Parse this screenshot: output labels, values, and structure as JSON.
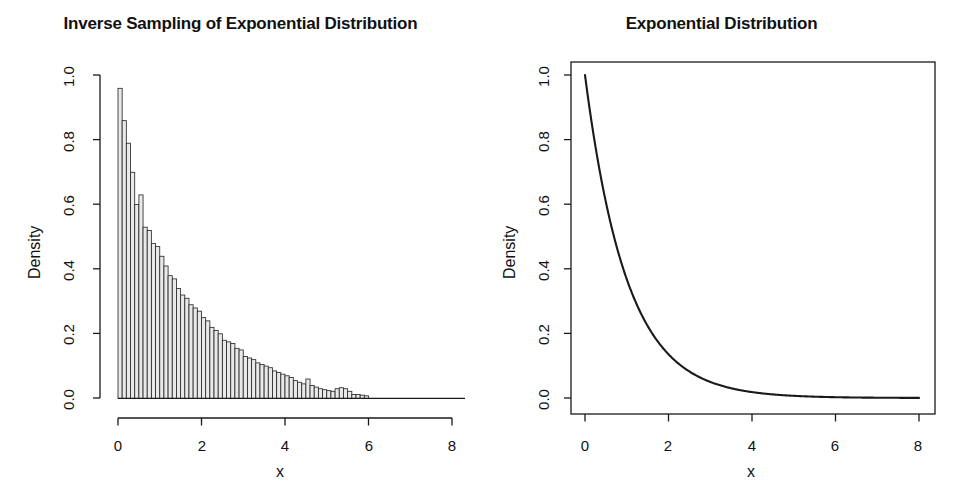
{
  "figure": {
    "background": "#ffffff",
    "foreground": "#1a1a1a",
    "bar_fill": "#e9e9e9",
    "bar_stroke": "#2b2b2b"
  },
  "panels": [
    {
      "id": "left",
      "title": "Inverse Sampling of Exponential Distribution",
      "xlabel": "x",
      "ylabel": "Density",
      "xticks": [
        "0",
        "2",
        "4",
        "6",
        "8"
      ],
      "yticks": [
        "0.0",
        "0.2",
        "0.4",
        "0.6",
        "0.8",
        "1.0"
      ]
    },
    {
      "id": "right",
      "title": "Exponential Distribution",
      "xlabel": "x",
      "ylabel": "Density",
      "xticks": [
        "0",
        "2",
        "4",
        "6",
        "8"
      ],
      "yticks": [
        "0.0",
        "0.2",
        "0.4",
        "0.6",
        "0.8",
        "1.0"
      ]
    }
  ],
  "chart_data": [
    {
      "type": "bar",
      "subtype": "histogram",
      "title": "Inverse Sampling of Exponential Distribution",
      "xlabel": "x",
      "ylabel": "Density",
      "xlim": [
        0,
        8.6
      ],
      "ylim": [
        0,
        1.04
      ],
      "xticks": [
        0,
        2,
        4,
        6,
        8
      ],
      "yticks": [
        0.0,
        0.2,
        0.4,
        0.6,
        0.8,
        1.0
      ],
      "grid": false,
      "legend": null,
      "bin_width": 0.1,
      "bin_starts": [
        0.0,
        0.1,
        0.2,
        0.3,
        0.4,
        0.5,
        0.6,
        0.7,
        0.8,
        0.9,
        1.0,
        1.1,
        1.2,
        1.3,
        1.4,
        1.5,
        1.6,
        1.7,
        1.8,
        1.9,
        2.0,
        2.1,
        2.2,
        2.3,
        2.4,
        2.5,
        2.6,
        2.7,
        2.8,
        2.9,
        3.0,
        3.1,
        3.2,
        3.3,
        3.4,
        3.5,
        3.6,
        3.7,
        3.8,
        3.9,
        4.0,
        4.1,
        4.2,
        4.3,
        4.4,
        4.5,
        4.6,
        4.7,
        4.8,
        4.9,
        5.0,
        5.1,
        5.2,
        5.3,
        5.4,
        5.5,
        5.6,
        5.7,
        5.8,
        5.9
      ],
      "values": [
        0.96,
        0.86,
        0.79,
        0.7,
        0.6,
        0.63,
        0.53,
        0.52,
        0.48,
        0.47,
        0.44,
        0.41,
        0.38,
        0.37,
        0.34,
        0.32,
        0.31,
        0.29,
        0.28,
        0.27,
        0.25,
        0.24,
        0.22,
        0.21,
        0.2,
        0.18,
        0.175,
        0.17,
        0.155,
        0.15,
        0.13,
        0.125,
        0.12,
        0.11,
        0.105,
        0.1,
        0.095,
        0.085,
        0.08,
        0.075,
        0.07,
        0.065,
        0.055,
        0.05,
        0.045,
        0.06,
        0.04,
        0.035,
        0.03,
        0.027,
        0.024,
        0.022,
        0.03,
        0.033,
        0.03,
        0.022,
        0.012,
        0.012,
        0.01,
        0.008
      ]
    },
    {
      "type": "line",
      "title": "Exponential Distribution",
      "xlabel": "x",
      "ylabel": "Density",
      "xlim": [
        0,
        8
      ],
      "ylim": [
        0,
        1.04
      ],
      "xticks": [
        0,
        2,
        4,
        6,
        8
      ],
      "yticks": [
        0.0,
        0.2,
        0.4,
        0.6,
        0.8,
        1.0
      ],
      "grid": false,
      "legend": null,
      "function": "exp(-x)",
      "x": [
        0.0,
        0.25,
        0.5,
        0.75,
        1.0,
        1.25,
        1.5,
        1.75,
        2.0,
        2.25,
        2.5,
        2.75,
        3.0,
        3.25,
        3.5,
        3.75,
        4.0,
        4.5,
        5.0,
        5.5,
        6.0,
        6.5,
        7.0,
        7.5,
        8.0
      ],
      "y": [
        1.0,
        0.7788,
        0.6065,
        0.4724,
        0.3679,
        0.2865,
        0.2231,
        0.1738,
        0.1353,
        0.1054,
        0.0821,
        0.0639,
        0.0498,
        0.0388,
        0.0302,
        0.0235,
        0.0183,
        0.0111,
        0.0067,
        0.0041,
        0.0025,
        0.0015,
        0.0009,
        0.0006,
        0.0003
      ]
    }
  ]
}
